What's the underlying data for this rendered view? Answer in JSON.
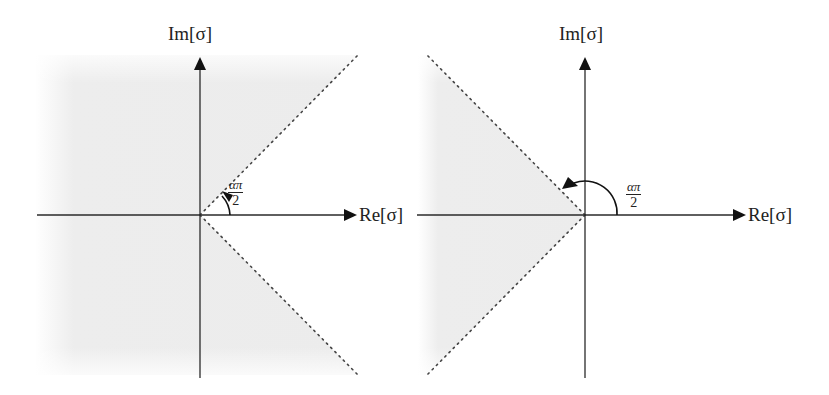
{
  "figure": {
    "panels": [
      {
        "id": "left",
        "x_axis_label": "Re[σ]",
        "y_axis_label": "Im[σ]",
        "angle_label": {
          "numerator": "απ",
          "denominator": "2"
        },
        "region": "shaded half-plane except wedge of half-angle απ/2 around positive real axis",
        "origin": [
          200,
          215
        ]
      },
      {
        "id": "right",
        "x_axis_label": "Re[σ]",
        "y_axis_label": "Im[σ]",
        "angle_label": {
          "numerator": "απ",
          "denominator": "2"
        },
        "region": "shaded wedge of half-angle (π − απ/2) around negative real axis",
        "origin": [
          585,
          215
        ]
      }
    ],
    "colors": {
      "axis": "#2a2a2a",
      "dotted_boundary": "#444444",
      "shade": "#ececec",
      "background": "#ffffff"
    }
  }
}
